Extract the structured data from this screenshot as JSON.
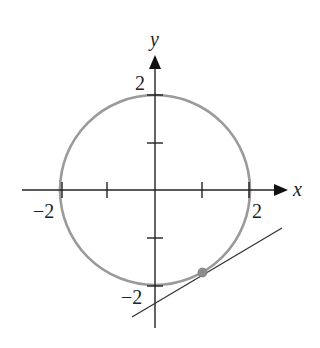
{
  "diagram": {
    "title": "",
    "axes": {
      "x_label": "x",
      "y_label": "y",
      "x_ticks": [
        -2,
        -1,
        1,
        2
      ],
      "y_ticks": [
        -2,
        -1,
        1,
        2
      ],
      "labeled_ticks": {
        "x_neg": "−2",
        "x_pos": "2",
        "y_pos": "2",
        "y_neg": "−2"
      }
    },
    "circle": {
      "center": [
        0,
        0
      ],
      "radius": 2,
      "color": "#9a9a9a"
    },
    "tangent_point": {
      "x": 1,
      "y": -1.732,
      "color": "#8c8c8c"
    },
    "tangent_line": {
      "slope": 0.577,
      "color": "#333333"
    },
    "axis_color": "#222222"
  }
}
